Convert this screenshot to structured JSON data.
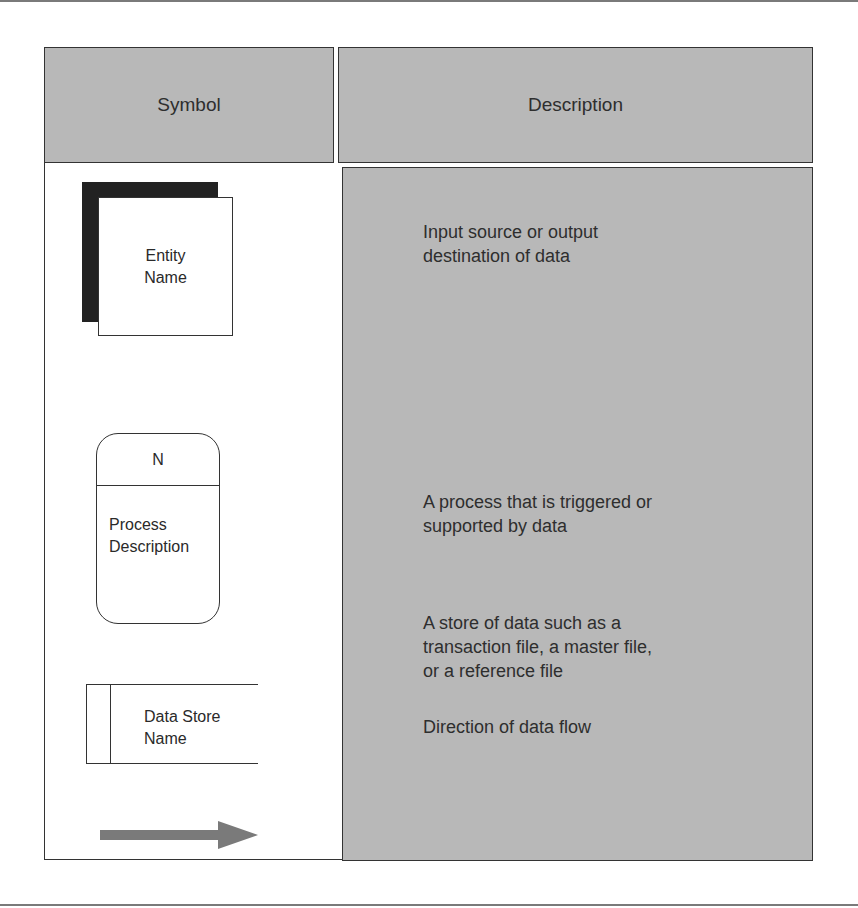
{
  "header": {
    "symbol": "Symbol",
    "description": "Description"
  },
  "rows": [
    {
      "symbol": "external-entity",
      "symbol_label_line1": "Entity",
      "symbol_label_line2": "Name",
      "description_line1": "Input source or output",
      "description_line2": "destination of data"
    },
    {
      "symbol": "process",
      "symbol_id": "N",
      "symbol_label_line1": "Process",
      "symbol_label_line2": "Description",
      "description_line1": "A process that is triggered or",
      "description_line2": "supported by data"
    },
    {
      "symbol": "data-store",
      "symbol_label_line1": "Data Store",
      "symbol_label_line2": "Name",
      "description_line1": "A store of data such as a",
      "description_line2": "transaction file, a master file,",
      "description_line3": "or a reference file"
    },
    {
      "symbol": "data-flow-arrow",
      "description_line1": "Direction of data flow"
    }
  ],
  "colors": {
    "header_fill": "#b8b8b8",
    "description_fill": "#b8b8b8",
    "entity_shadow": "#222222",
    "arrow": "#7a7a7a",
    "border": "#333333"
  }
}
